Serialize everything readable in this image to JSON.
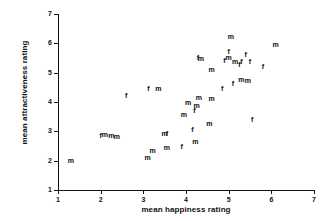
{
  "chart_data": {
    "type": "scatter",
    "title": "",
    "subtitle": "",
    "xlabel": "mean happiness rating",
    "ylabel": "mean attractiveness rating",
    "xlim": [
      1,
      7
    ],
    "ylim": [
      1,
      7
    ],
    "xticks": [
      1,
      2,
      3,
      4,
      5,
      6,
      7
    ],
    "yticks": [
      1,
      2,
      3,
      4,
      5,
      6,
      7
    ],
    "grid": false,
    "legend": "none",
    "point_marker": "text-label-by-gender",
    "marker_labels": {
      "m": "m",
      "f": "f"
    },
    "annotations": [],
    "series": [
      {
        "name": "m",
        "label": "m",
        "points": [
          {
            "x": 1.3,
            "y": 2.0,
            "label": "m"
          },
          {
            "x": 2.1,
            "y": 2.87,
            "label": "m"
          },
          {
            "x": 2.25,
            "y": 2.85,
            "label": "m"
          },
          {
            "x": 2.38,
            "y": 2.82,
            "label": "m"
          },
          {
            "x": 3.1,
            "y": 2.08,
            "label": "m"
          },
          {
            "x": 3.22,
            "y": 2.33,
            "label": "m"
          },
          {
            "x": 3.55,
            "y": 2.42,
            "label": "m"
          },
          {
            "x": 3.5,
            "y": 2.92,
            "label": "m"
          },
          {
            "x": 3.35,
            "y": 4.45,
            "label": "m"
          },
          {
            "x": 4.22,
            "y": 2.65,
            "label": "m"
          },
          {
            "x": 3.95,
            "y": 3.55,
            "label": "m"
          },
          {
            "x": 4.05,
            "y": 3.95,
            "label": "m"
          },
          {
            "x": 4.25,
            "y": 3.85,
            "label": "m"
          },
          {
            "x": 4.3,
            "y": 4.15,
            "label": "m"
          },
          {
            "x": 4.35,
            "y": 5.45,
            "label": "m"
          },
          {
            "x": 4.55,
            "y": 3.25,
            "label": "m"
          },
          {
            "x": 4.6,
            "y": 4.1,
            "label": "m"
          },
          {
            "x": 4.6,
            "y": 5.1,
            "label": "m"
          },
          {
            "x": 5.0,
            "y": 5.5,
            "label": "m"
          },
          {
            "x": 5.05,
            "y": 6.2,
            "label": "m"
          },
          {
            "x": 5.15,
            "y": 5.35,
            "label": "m"
          },
          {
            "x": 5.3,
            "y": 4.75,
            "label": "m"
          },
          {
            "x": 5.45,
            "y": 4.7,
            "label": "m"
          },
          {
            "x": 6.1,
            "y": 5.95,
            "label": "m"
          }
        ]
      },
      {
        "name": "f",
        "label": "f",
        "points": [
          {
            "x": 2.0,
            "y": 2.85,
            "label": "f"
          },
          {
            "x": 2.6,
            "y": 4.2,
            "label": "f"
          },
          {
            "x": 3.55,
            "y": 2.9,
            "label": "f"
          },
          {
            "x": 3.12,
            "y": 4.45,
            "label": "f"
          },
          {
            "x": 3.9,
            "y": 2.45,
            "label": "f"
          },
          {
            "x": 4.15,
            "y": 3.05,
            "label": "f"
          },
          {
            "x": 4.2,
            "y": 3.7,
            "label": "f"
          },
          {
            "x": 4.28,
            "y": 5.5,
            "label": "f"
          },
          {
            "x": 4.85,
            "y": 4.45,
            "label": "f"
          },
          {
            "x": 4.9,
            "y": 5.4,
            "label": "f"
          },
          {
            "x": 5.0,
            "y": 5.7,
            "label": "f"
          },
          {
            "x": 5.1,
            "y": 4.6,
            "label": "f"
          },
          {
            "x": 5.25,
            "y": 5.25,
            "label": "f"
          },
          {
            "x": 5.3,
            "y": 5.35,
            "label": "f"
          },
          {
            "x": 5.4,
            "y": 5.6,
            "label": "f"
          },
          {
            "x": 5.5,
            "y": 5.35,
            "label": "f"
          },
          {
            "x": 5.55,
            "y": 3.4,
            "label": "f"
          },
          {
            "x": 5.8,
            "y": 5.2,
            "label": "f"
          }
        ]
      }
    ]
  }
}
